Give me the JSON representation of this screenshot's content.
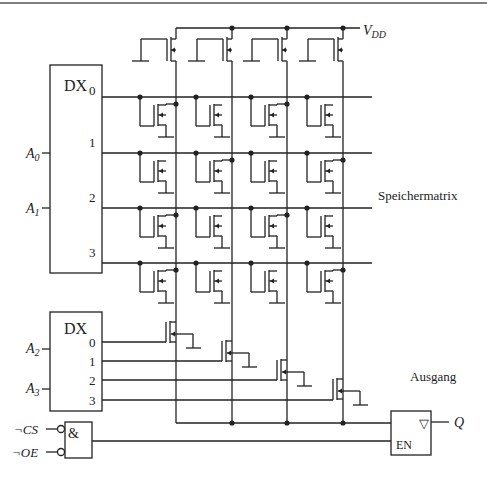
{
  "diagram": {
    "title_hint": "ROM memory circuit",
    "vdd_label": "V",
    "vdd_sub": "DD",
    "row_decoder": {
      "label": "DX",
      "outputs": [
        "0",
        "1",
        "2",
        "3"
      ],
      "inputs": [
        {
          "name": "A",
          "sub": "0"
        },
        {
          "name": "A",
          "sub": "1"
        }
      ]
    },
    "col_decoder": {
      "label": "DX",
      "outputs": [
        "0",
        "1",
        "2",
        "3"
      ],
      "inputs": [
        {
          "name": "A",
          "sub": "2"
        },
        {
          "name": "A",
          "sub": "3"
        }
      ]
    },
    "matrix_label": "Speichermatrix",
    "output_label": "Ausgang",
    "and_gate": {
      "label": "&",
      "inputs": [
        "¬CS",
        "¬OE"
      ]
    },
    "buffer": {
      "symbol": "▽",
      "enable": "EN",
      "output": "Q"
    },
    "bits": [
      [
        1,
        0,
        1,
        0
      ],
      [
        0,
        1,
        0,
        1
      ],
      [
        1,
        0,
        1,
        0
      ],
      [
        1,
        0,
        0,
        1
      ]
    ]
  }
}
